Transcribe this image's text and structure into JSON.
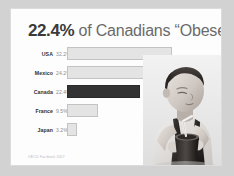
{
  "slide": {
    "title_percent": "22.4%",
    "title_rest": " of Canadians “Obese”",
    "footnote": "OECD Factbook 2007",
    "background_color": "#d2d2d2",
    "card_color": "#fdfdfd",
    "highlight_color": "#333333",
    "bar_color": "#e4e4e4"
  },
  "photo": {
    "alt": "grayscale photo of a young boy drinking from a cup with a straw"
  },
  "chart_data": {
    "type": "bar",
    "orientation": "horizontal",
    "title": "22.4% of Canadians “Obese”",
    "xlabel": "",
    "ylabel": "",
    "categories": [
      "USA",
      "Mexico",
      "Canada",
      "France",
      "Japan"
    ],
    "values": [
      32.2,
      24.2,
      22.4,
      9.5,
      3.2
    ],
    "value_labels": [
      "32.2%",
      "24.2%",
      "22.4%",
      "9.5%",
      "3.2%"
    ],
    "highlight_category": "Canada",
    "xlim": [
      0,
      35
    ],
    "grid": false,
    "legend": false,
    "source": "OECD Factbook 2007"
  }
}
